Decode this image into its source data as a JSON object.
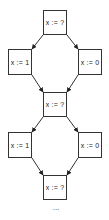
{
  "diagram": {
    "type": "state-transition-graph",
    "colors": {
      "stroke": "#333333",
      "fill": "#ffffff",
      "text": "#222222"
    },
    "nodes": [
      {
        "id": "n1",
        "label": "x := ?",
        "x": 43,
        "y": 10,
        "w": 24,
        "h": 25
      },
      {
        "id": "n2",
        "label": "x := 1",
        "x": 8,
        "y": 49,
        "w": 24,
        "h": 26
      },
      {
        "id": "n3",
        "label": "x := 0",
        "x": 78,
        "y": 49,
        "w": 24,
        "h": 26
      },
      {
        "id": "n4",
        "label": "x := ?",
        "x": 43,
        "y": 92,
        "w": 24,
        "h": 25
      },
      {
        "id": "n5",
        "label": "x := 1",
        "x": 8,
        "y": 132,
        "w": 24,
        "h": 26
      },
      {
        "id": "n6",
        "label": "x := 0",
        "x": 78,
        "y": 132,
        "w": 24,
        "h": 26
      },
      {
        "id": "n7",
        "label": "x := ?",
        "x": 43,
        "y": 175,
        "w": 24,
        "h": 25
      }
    ],
    "edges": [
      {
        "from": "n1",
        "to": "n2"
      },
      {
        "from": "n1",
        "to": "n3"
      },
      {
        "from": "n2",
        "to": "n4"
      },
      {
        "from": "n3",
        "to": "n4"
      },
      {
        "from": "n4",
        "to": "n5"
      },
      {
        "from": "n4",
        "to": "n6"
      },
      {
        "from": "n5",
        "to": "n7"
      },
      {
        "from": "n6",
        "to": "n7"
      }
    ],
    "continuation": "..."
  }
}
